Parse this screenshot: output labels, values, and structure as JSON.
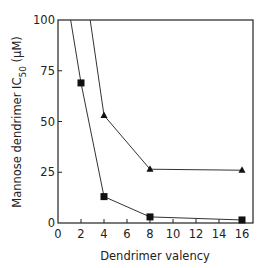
{
  "chart_data": {
    "type": "line",
    "title": "",
    "xlabel": "Dendrimer valency",
    "ylabel": "Mannose dendrimer IC50 (µM)",
    "ylabel_parts": {
      "main": "Mannose dendrimer IC",
      "sub": "50",
      "unit": " (µM)"
    },
    "xlim": [
      0,
      17
    ],
    "ylim": [
      0,
      100
    ],
    "xticks": [
      0,
      2,
      4,
      6,
      8,
      10,
      12,
      14,
      16
    ],
    "yticks": [
      0,
      25,
      50,
      75,
      100
    ],
    "grid": false,
    "legend": null,
    "series": [
      {
        "name": "squares",
        "marker": "square",
        "x": [
          2,
          4,
          8,
          16
        ],
        "values": [
          69,
          13,
          3,
          1.5
        ],
        "offscale_start": {
          "x": 1.1,
          "y": 100
        }
      },
      {
        "name": "triangles",
        "marker": "triangle",
        "x": [
          4,
          8,
          16
        ],
        "values": [
          53,
          26.5,
          26
        ],
        "offscale_start": {
          "x": 2.8,
          "y": 100
        }
      }
    ]
  }
}
